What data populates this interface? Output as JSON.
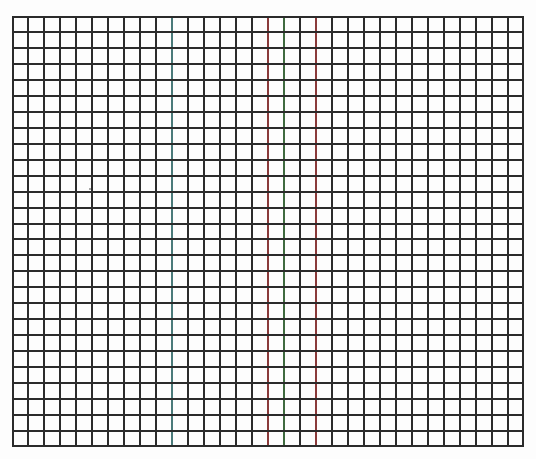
{
  "sheet": {
    "type": "graph-paper",
    "background_color": "#fdfdfd",
    "line_color": "#2b2b2b",
    "grid": {
      "left": 12,
      "top": 16,
      "right": 524,
      "bottom": 447,
      "columns": 32,
      "rows": 27,
      "cell_size": 16,
      "line_width": 2
    },
    "tinted_vertical_lines": [
      {
        "column_index": 10,
        "color": "#4a7a7a"
      },
      {
        "column_index": 16,
        "color": "#8a3a3a"
      },
      {
        "column_index": 17,
        "color": "#3f6a3f"
      },
      {
        "column_index": 19,
        "color": "#8a3a3a"
      }
    ],
    "specks": [
      {
        "x": 89,
        "y": 188
      }
    ]
  }
}
